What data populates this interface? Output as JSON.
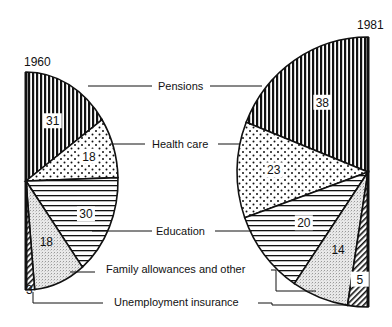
{
  "chart_data": [
    {
      "type": "pie",
      "subtype": "half-pie (right half)",
      "title": "1960",
      "unit": "percent",
      "categories": [
        "Pensions",
        "Health care",
        "Education",
        "Family allowances and other",
        "Unemployment insurance"
      ],
      "values": [
        31,
        18,
        30,
        18,
        3
      ],
      "patterns": [
        "vertical-lines",
        "dots",
        "horizontal-lines",
        "stipple",
        "diagonal-hatch"
      ]
    },
    {
      "type": "pie",
      "subtype": "half-pie (left half)",
      "title": "1981",
      "unit": "percent",
      "categories": [
        "Pensions",
        "Health care",
        "Education",
        "Family allowances and other",
        "Unemployment insurance"
      ],
      "values": [
        38,
        23,
        20,
        14,
        5
      ],
      "patterns": [
        "vertical-lines",
        "dots",
        "horizontal-lines",
        "stipple",
        "diagonal-hatch"
      ]
    }
  ],
  "labels": {
    "year_left": "1960",
    "year_right": "1981",
    "pensions": "Pensions",
    "health": "Health care",
    "education": "Education",
    "family": "Family allowances and other",
    "unemployment": "Unemployment insurance"
  },
  "geometry": {
    "left": {
      "cx": 26,
      "cy": 181,
      "rx": 92,
      "ry": 109,
      "dir": 1
    },
    "right": {
      "cx": 368,
      "cy": 172,
      "rx": 131,
      "ry": 135,
      "dir": -1
    }
  }
}
